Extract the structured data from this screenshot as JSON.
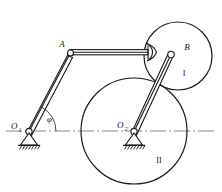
{
  "figure": {
    "kind": "kinematic-mechanism-diagram",
    "background_color": "#ffffff",
    "line_color": "#1a1a1a",
    "axis_color": "#7a7a7a"
  },
  "labels": {
    "point_a": "A",
    "point_b": "B",
    "pivot_o1_base": "O",
    "pivot_o1_sub": "1",
    "pivot_o2_base": "O",
    "pivot_o2_sub": "2",
    "angle_phi": "φ",
    "wheel_one": "I",
    "wheel_two": "II"
  },
  "geometry": {
    "wheel_i": {
      "cx": 178,
      "cy": 56,
      "r": 34
    },
    "wheel_ii": {
      "cx": 134,
      "cy": 131,
      "r": 53
    },
    "pivot_o1": {
      "x": 29,
      "y": 131
    },
    "pivot_o2": {
      "x": 134,
      "y": 131
    },
    "point_a": {
      "x": 70,
      "y": 53
    },
    "point_b": {
      "x": 171,
      "y": 55
    },
    "centerline": {
      "x1": 6,
      "x2": 216,
      "y": 131
    },
    "angle_phi_degrees": 62
  }
}
